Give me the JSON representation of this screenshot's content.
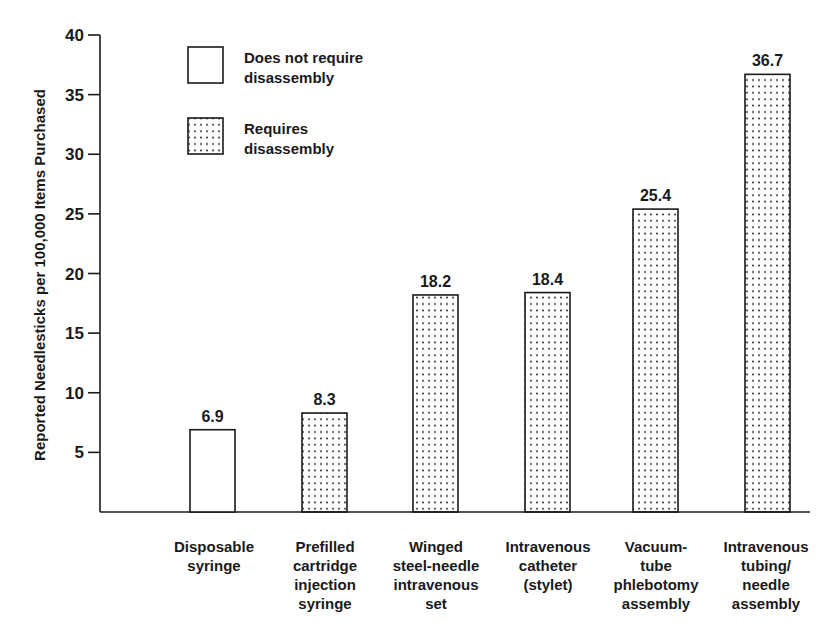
{
  "chart_data": {
    "type": "bar",
    "title": "",
    "xlabel": "",
    "ylabel": "Reported Needlesticks per 100,000 Items Purchased",
    "ylim": [
      0,
      40
    ],
    "yticks": [
      5,
      10,
      15,
      20,
      25,
      30,
      35,
      40
    ],
    "grid": false,
    "legend_position": "upper-left inside plot",
    "categories": [
      [
        "Disposable",
        "syringe"
      ],
      [
        "Prefilled",
        "cartridge",
        "injection",
        "syringe"
      ],
      [
        "Winged",
        "steel-needle",
        "intravenous",
        "set"
      ],
      [
        "Intravenous",
        "catheter",
        "(stylet)"
      ],
      [
        "Vacuum-",
        "tube",
        "phlebotomy",
        "assembly"
      ],
      [
        "Intravenous",
        "tubing/",
        "needle",
        "assembly"
      ]
    ],
    "values": [
      6.9,
      8.3,
      18.2,
      18.4,
      25.4,
      36.7
    ],
    "value_labels": [
      "6.9",
      "8.3",
      "18.2",
      "18.4",
      "25.4",
      "36.7"
    ],
    "bar_group": [
      "none",
      "dotted",
      "dotted",
      "dotted",
      "dotted",
      "dotted"
    ],
    "legend": [
      {
        "key": "none",
        "lines": [
          "Does not require",
          "disassembly"
        ],
        "fill": "blank"
      },
      {
        "key": "dotted",
        "lines": [
          "Requires",
          "disassembly"
        ],
        "fill": "dotted"
      }
    ],
    "colors": {
      "ink": "#1a1a1a",
      "background": "#ffffff"
    }
  }
}
